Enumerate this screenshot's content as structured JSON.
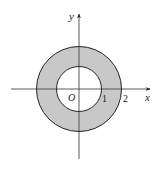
{
  "diagram": {
    "type": "annulus-region",
    "axes": {
      "x_label": "x",
      "y_label": "y",
      "origin_label": "O"
    },
    "ticks": {
      "inner_radius_label": "1",
      "outer_radius_label": "2"
    },
    "circles": [
      {
        "name": "inner",
        "radius": 1
      },
      {
        "name": "outer",
        "radius": 2
      }
    ],
    "colors": {
      "fill": "#c8c8c8",
      "stroke": "#222222",
      "axis": "#333333"
    }
  }
}
